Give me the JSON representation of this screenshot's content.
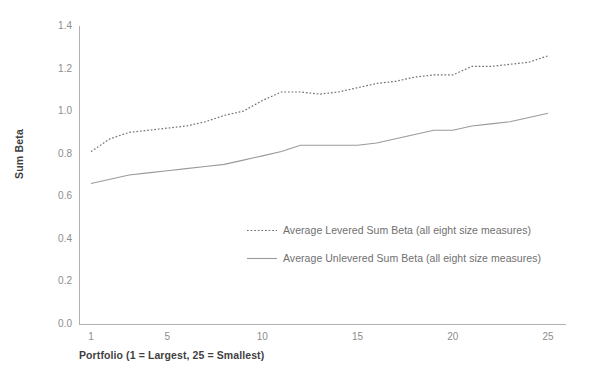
{
  "chart_data": {
    "type": "line",
    "title": "",
    "xlabel": "Portfolio (1 = Largest, 25 = Smallest)",
    "ylabel": "Sum Beta",
    "xlim": [
      1,
      25
    ],
    "ylim": [
      0.0,
      1.4
    ],
    "grid": false,
    "legend_position": "center",
    "x_ticks": [
      "1",
      "5",
      "10",
      "15",
      "20",
      "25"
    ],
    "x_tick_values": [
      1,
      5,
      10,
      15,
      20,
      25
    ],
    "y_ticks": [
      "0.0",
      "0.2",
      "0.4",
      "0.6",
      "0.8",
      "1.0",
      "1.2",
      "1.4"
    ],
    "y_tick_values": [
      0.0,
      0.2,
      0.4,
      0.6,
      0.8,
      1.0,
      1.2,
      1.4
    ],
    "x": [
      1,
      2,
      3,
      4,
      5,
      6,
      7,
      8,
      9,
      10,
      11,
      12,
      13,
      14,
      15,
      16,
      17,
      18,
      19,
      20,
      21,
      22,
      23,
      24,
      25
    ],
    "series": [
      {
        "name": "Average Levered Sum Beta (all eight size measures)",
        "style": "dotted",
        "color": "#6f6f6f",
        "values": [
          0.81,
          0.87,
          0.9,
          0.91,
          0.92,
          0.93,
          0.95,
          0.98,
          1.0,
          1.05,
          1.09,
          1.09,
          1.08,
          1.09,
          1.11,
          1.13,
          1.14,
          1.16,
          1.17,
          1.17,
          1.21,
          1.21,
          1.22,
          1.23,
          1.26
        ]
      },
      {
        "name": "Average Unlevered Sum Beta (all eight size measures)",
        "style": "solid",
        "color": "#9a9a9a",
        "values": [
          0.66,
          0.68,
          0.7,
          0.71,
          0.72,
          0.73,
          0.74,
          0.75,
          0.77,
          0.79,
          0.81,
          0.84,
          0.84,
          0.84,
          0.84,
          0.85,
          0.87,
          0.89,
          0.91,
          0.91,
          0.93,
          0.94,
          0.95,
          0.97,
          0.99
        ]
      }
    ]
  },
  "legend": {
    "items": [
      {
        "label": "Average Levered Sum Beta (all eight size measures)",
        "style": "dotted"
      },
      {
        "label": "Average Unlevered Sum Beta (all eight size measures)",
        "style": "solid"
      }
    ]
  },
  "colors": {
    "axis": "#b0b0b0",
    "tick_text": "#8d8d8d",
    "title_text": "#3f3f3f",
    "legend_text": "#6f6f6f",
    "levered_line": "#6f6f6f",
    "unlevered_line": "#9a9a9a",
    "background": "#ffffff"
  }
}
